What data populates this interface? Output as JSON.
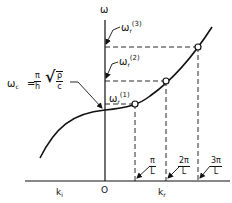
{
  "figure": {
    "y_axis_label": "ω",
    "origin_label": "O",
    "x_left_label": {
      "base": "k",
      "sub": "i"
    },
    "x_right_label": {
      "base": "k",
      "sub": "r"
    },
    "cutoff_label": {
      "lhs": "ω",
      "lhs_sub": "c",
      "eq": "=",
      "frac_num": "π",
      "frac_den": "h",
      "sqrt_num": "ρ",
      "sqrt_den": "c"
    },
    "resonance_labels": [
      {
        "base": "ω",
        "sub": "r",
        "sup": "(1)"
      },
      {
        "base": "ω",
        "sub": "r",
        "sup": "(2)"
      },
      {
        "base": "ω",
        "sub": "r",
        "sup": "(3)"
      }
    ],
    "wavenumber_labels": [
      {
        "num": "π",
        "den": "L"
      },
      {
        "num": "2π",
        "den": "L"
      },
      {
        "num": "3π",
        "den": "L"
      }
    ],
    "colors": {
      "ink": "#111111",
      "background": "#ffffff"
    }
  }
}
